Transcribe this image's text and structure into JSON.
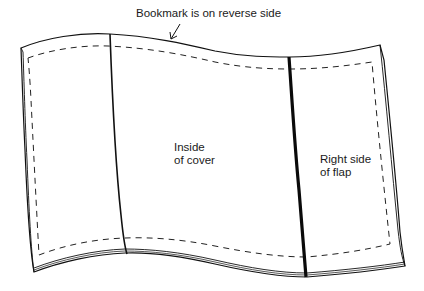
{
  "diagram": {
    "callout": {
      "text": "Bookmark is on reverse side"
    },
    "panels": [
      {
        "id": "left-panel",
        "lines": []
      },
      {
        "id": "inside-of-cover",
        "lines": [
          "Inside",
          "of cover"
        ]
      },
      {
        "id": "right-side-of-flap",
        "lines": [
          "Right side",
          "of flap"
        ]
      }
    ],
    "colors": {
      "stroke": "#111111",
      "background": "#ffffff"
    }
  }
}
